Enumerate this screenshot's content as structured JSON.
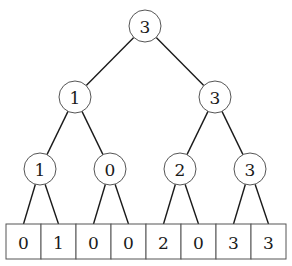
{
  "diagram": {
    "type": "segment-tree",
    "levels": [
      {
        "nodes": [
          {
            "label": "3",
            "cx": 145,
            "cy": 26
          }
        ]
      },
      {
        "nodes": [
          {
            "label": "1",
            "cx": 75,
            "cy": 97
          },
          {
            "label": "3",
            "cx": 215,
            "cy": 97
          }
        ]
      },
      {
        "nodes": [
          {
            "label": "1",
            "cx": 40,
            "cy": 169
          },
          {
            "label": "0",
            "cx": 110,
            "cy": 169
          },
          {
            "label": "2",
            "cx": 180,
            "cy": 169
          },
          {
            "label": "3",
            "cx": 250,
            "cy": 169
          }
        ]
      }
    ],
    "node_radius": 16,
    "array": {
      "values": [
        "0",
        "1",
        "0",
        "0",
        "2",
        "0",
        "3",
        "3"
      ],
      "x": 6,
      "y": 224,
      "width": 280,
      "height": 35
    }
  }
}
